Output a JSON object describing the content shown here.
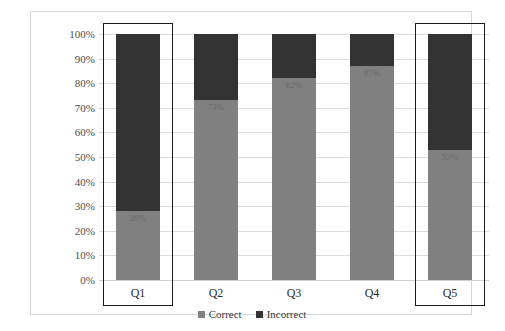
{
  "chart_data": {
    "type": "bar",
    "subtype": "100% stacked bar",
    "title": "",
    "xlabel": "",
    "ylabel": "",
    "categories": [
      "Q1",
      "Q2",
      "Q3",
      "Q4",
      "Q5"
    ],
    "series": [
      {
        "name": "Correct",
        "values": [
          28,
          73,
          82,
          87,
          53
        ],
        "color": "#808080"
      },
      {
        "name": "Incorrect",
        "values": [
          72,
          27,
          18,
          13,
          47
        ],
        "color": "#333333"
      }
    ],
    "data_labels": [
      "28%",
      "73%",
      "82%",
      "87%",
      "53%"
    ],
    "ylim": [
      0,
      100
    ],
    "yticks": [
      0,
      10,
      20,
      30,
      40,
      50,
      60,
      70,
      80,
      90,
      100
    ],
    "ytick_labels": [
      "0%",
      "10%",
      "20%",
      "30%",
      "40%",
      "50%",
      "60%",
      "70%",
      "80%",
      "90%",
      "100%"
    ],
    "grid": true,
    "legend_position": "bottom",
    "highlighted_categories": [
      "Q1",
      "Q5"
    ]
  },
  "legend": {
    "items": [
      {
        "label": "Correct"
      },
      {
        "label": "Incorrect"
      }
    ]
  },
  "colors": {
    "correct": "#808080",
    "incorrect": "#333333",
    "gridline": "#dcdcdc",
    "highlight_border": "#1b1b1b",
    "frame_border": "#d8d8d8",
    "tick_text": "#4d4d4d"
  }
}
